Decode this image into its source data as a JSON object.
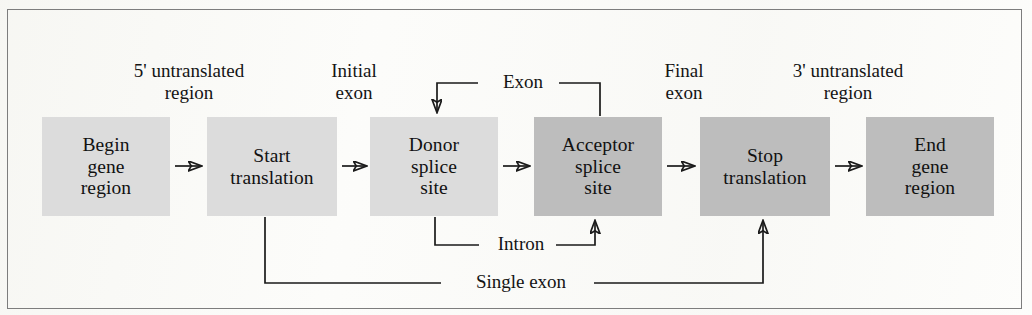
{
  "figure": {
    "type": "flow-diagram",
    "title_visible": false,
    "colors": {
      "box_light": "#dcdcdc",
      "box_dark": "#bdbdbd",
      "line": "#1a1a1a",
      "frame": "#7d7d7d",
      "background": "#fdfdfb",
      "text": "#111111"
    }
  },
  "nodes": [
    {
      "id": "begin-gene-region",
      "label": "Begin\ngene\nregion",
      "shade": "light",
      "x": 42,
      "y": 117,
      "w": 128,
      "h": 99
    },
    {
      "id": "start-translation",
      "label": "Start\ntranslation",
      "shade": "light",
      "x": 207,
      "y": 117,
      "w": 130,
      "h": 99
    },
    {
      "id": "donor-splice-site",
      "label": "Donor\nsplice\nsite",
      "shade": "light",
      "x": 370,
      "y": 117,
      "w": 128,
      "h": 99
    },
    {
      "id": "acceptor-splice-site",
      "label": "Acceptor\nsplice\nsite",
      "shade": "dark",
      "x": 534,
      "y": 117,
      "w": 128,
      "h": 99
    },
    {
      "id": "stop-translation",
      "label": "Stop\ntranslation",
      "shade": "dark",
      "x": 700,
      "y": 117,
      "w": 130,
      "h": 99
    },
    {
      "id": "end-gene-region",
      "label": "End\ngene\nregion",
      "shade": "dark",
      "x": 866,
      "y": 117,
      "w": 128,
      "h": 99
    }
  ],
  "top_labels": [
    {
      "id": "five-prime-untranslated-region",
      "text": "5' untranslated\nregion",
      "cx": 189,
      "y": 60
    },
    {
      "id": "initial-exon",
      "text": "Initial\nexon",
      "cx": 354,
      "y": 60
    },
    {
      "id": "final-exon",
      "text": "Final\nexon",
      "cx": 684,
      "y": 60
    },
    {
      "id": "three-prime-untranslated-region",
      "text": "3' untranslated\nregion",
      "cx": 848,
      "y": 60
    }
  ],
  "edge_labels": [
    {
      "id": "exon-label",
      "text": "Exon",
      "cx": 518,
      "cy": 83
    },
    {
      "id": "intron-label",
      "text": "Intron",
      "cx": 516,
      "cy": 245
    },
    {
      "id": "single-exon-label",
      "text": "Single exon",
      "cx": 516,
      "cy": 283
    }
  ],
  "connections": [
    {
      "id": "arrow-begin-to-start",
      "from": "begin-gene-region",
      "to": "start-translation",
      "kind": "arrow-right"
    },
    {
      "id": "arrow-start-to-donor",
      "from": "start-translation",
      "to": "donor-splice-site",
      "kind": "arrow-right"
    },
    {
      "id": "arrow-donor-to-acceptor",
      "from": "donor-splice-site",
      "to": "acceptor-splice-site",
      "kind": "arrow-right"
    },
    {
      "id": "arrow-acceptor-to-stop",
      "from": "acceptor-splice-site",
      "to": "stop-translation",
      "kind": "arrow-right"
    },
    {
      "id": "arrow-stop-to-end",
      "from": "stop-translation",
      "to": "end-gene-region",
      "kind": "arrow-right"
    },
    {
      "id": "exon-loop",
      "label": "Exon",
      "from": "acceptor-splice-site",
      "to": "donor-splice-site",
      "kind": "bracket-above"
    },
    {
      "id": "intron-loop",
      "label": "Intron",
      "from": "donor-splice-site",
      "to": "acceptor-splice-site",
      "kind": "bracket-below"
    },
    {
      "id": "single-exon-loop",
      "label": "Single exon",
      "from": "start-translation",
      "to": "stop-translation",
      "kind": "bracket-below-long"
    }
  ]
}
